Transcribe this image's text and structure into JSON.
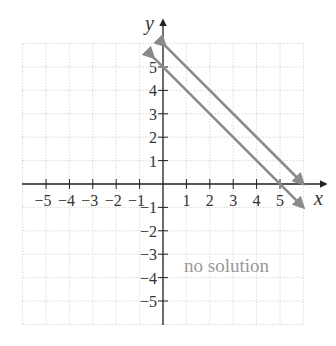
{
  "chart_data": {
    "type": "line",
    "title": "",
    "xlabel": "x",
    "ylabel": "y",
    "xlim": [
      -6,
      6
    ],
    "ylim": [
      -6,
      6
    ],
    "grid": true,
    "x_ticks": [
      -5,
      -4,
      -3,
      -2,
      -1,
      1,
      2,
      3,
      4,
      5
    ],
    "y_ticks": [
      -5,
      -4,
      -3,
      -2,
      -1,
      1,
      2,
      3,
      4,
      5
    ],
    "x_tick_labels": [
      "−5",
      "−4",
      "−3",
      "−2",
      "−1",
      "1",
      "2",
      "3",
      "4",
      "5"
    ],
    "y_tick_labels": [
      "−5",
      "−4",
      "−3",
      "−2",
      "−1",
      "1",
      "2",
      "3",
      "4",
      "5"
    ],
    "series": [
      {
        "name": "line 1",
        "equation": "y = -x + 5",
        "points": [
          [
            -0.4,
            5.4
          ],
          [
            6,
            -1
          ]
        ]
      },
      {
        "name": "line 2",
        "equation": "y = -x + 6",
        "points": [
          [
            0.1,
            5.9
          ],
          [
            6,
            0
          ]
        ]
      }
    ],
    "annotations": [
      {
        "text": "no solution",
        "x": 3.2,
        "y": -3.5
      }
    ],
    "colors": {
      "lines": "#8a8a8a",
      "axes": "#222222",
      "grid": "#bbbbbb"
    }
  }
}
